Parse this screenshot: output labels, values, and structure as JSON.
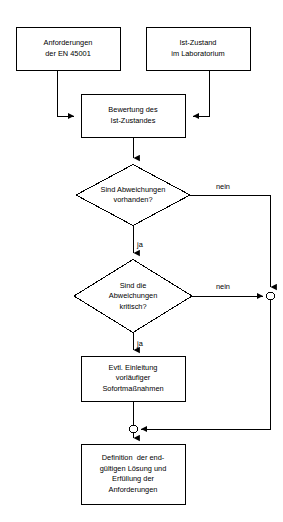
{
  "diagram": {
    "stroke_color": "#000000",
    "fill_color": "#ffffff",
    "background_color": "#ffffff",
    "nodes": [
      {
        "id": "anforderungen",
        "type": "process",
        "lines": [
          "Anforderungen",
          "der EN 45001"
        ],
        "line1": "Anforderungen",
        "line2": "der EN 45001",
        "x": 16,
        "y": 27,
        "w": 104,
        "h": 43
      },
      {
        "id": "ist-zustand",
        "type": "process",
        "lines": [
          "Ist-Zustand",
          "im Laboratorium"
        ],
        "line1": "Ist-Zustand",
        "line2": "im Laboratorium",
        "x": 146,
        "y": 27,
        "w": 104,
        "h": 43
      },
      {
        "id": "bewertung",
        "type": "process",
        "lines": [
          "Bewertung des",
          "Ist-Zustandes"
        ],
        "line1": "Bewertung des",
        "line2": "Ist-Zustandes",
        "x": 81,
        "y": 94,
        "w": 104,
        "h": 43
      },
      {
        "id": "abweichungen-vorhanden",
        "type": "decision",
        "lines": [
          "Sind Abweichungen",
          "vorhanden?"
        ],
        "line1": "Sind Abweichungen",
        "line2": "vorhanden?",
        "cx": 133,
        "cy": 195,
        "rx": 57,
        "ry": 31
      },
      {
        "id": "abweichungen-kritisch",
        "type": "decision",
        "lines": [
          "Sind die",
          "Abweichungen",
          "kritisch?"
        ],
        "line1": "Sind die",
        "line2": "Abweichungen",
        "line3": "kritisch?",
        "cx": 133,
        "cy": 296,
        "rx": 59,
        "ry": 37
      },
      {
        "id": "sofortmassnahmen",
        "type": "process",
        "lines": [
          "Evtl. Einleitung",
          "vorläufiger",
          "Sofortmaßnahmen"
        ],
        "line1": "Evtl. Einleitung",
        "line2": "vorläufiger",
        "line3": "Sofortmaßnahmen",
        "x": 81,
        "y": 356,
        "w": 104,
        "h": 45
      },
      {
        "id": "definition-loesung",
        "type": "process",
        "lines": [
          "Definition  der end-",
          "gültigen Lösung und",
          "Erfüllung der",
          "Anforderungen"
        ],
        "line1": "Definition  der end-",
        "line2": "gültigen Lösung und",
        "line3": "Erfüllung der",
        "line4": "Anforderungen",
        "x": 81,
        "y": 444,
        "w": 104,
        "h": 60
      }
    ],
    "junctions": [
      {
        "id": "junction-right",
        "cx": 270,
        "cy": 296,
        "r": 4
      },
      {
        "id": "junction-bottom",
        "cx": 133,
        "cy": 429,
        "r": 4
      }
    ],
    "edge_labels": [
      {
        "id": "nein-1",
        "text": "nein",
        "x": 216,
        "y": 182
      },
      {
        "id": "ja-1",
        "text": "ja",
        "x": 137,
        "y": 240
      },
      {
        "id": "nein-2",
        "text": "nein",
        "x": 216,
        "y": 282
      },
      {
        "id": "ja-2",
        "text": "ja",
        "x": 137,
        "y": 339
      }
    ]
  }
}
